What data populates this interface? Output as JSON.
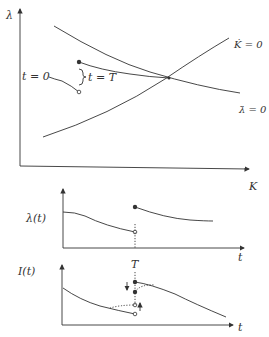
{
  "phase_diagram": {
    "y_axis_label": "λ",
    "x_axis_label": "K",
    "k_dot_label": "K̇ = 0",
    "lambda_dot_label": "λ̇ = 0",
    "t0_label": "t = 0",
    "tT_label": "t = T"
  },
  "lambda_plot": {
    "y_axis_label": "λ(t)",
    "x_axis_label": "t"
  },
  "investment_plot": {
    "y_axis_label": "I(t)",
    "x_axis_label": "t",
    "T_label": "T"
  }
}
